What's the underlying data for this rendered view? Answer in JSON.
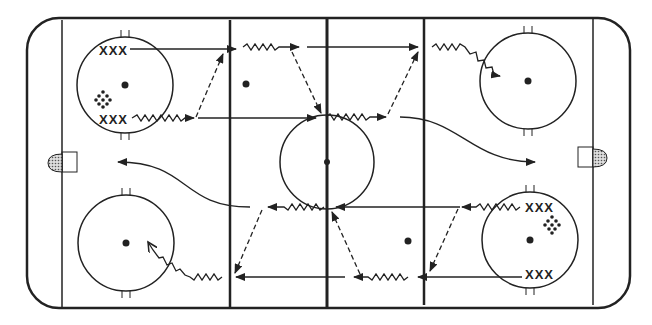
{
  "diagram": {
    "type": "hockey-drill",
    "colors": {
      "ink": "#222222",
      "background": "#ffffff",
      "net": "#999999"
    },
    "player_groups": [
      {
        "label": "XXX",
        "position": "top-left-circle-upper"
      },
      {
        "label": "XXX",
        "position": "top-left-circle-lower"
      },
      {
        "label": "XXX",
        "position": "bottom-right-circle-upper"
      },
      {
        "label": "XXX",
        "position": "bottom-right-circle-lower"
      }
    ],
    "pucks": [
      {
        "icon": "puck-cluster-icon",
        "position": "top-left-circle"
      },
      {
        "icon": "puck-cluster-icon",
        "position": "bottom-right-circle"
      }
    ],
    "legend": {
      "solid_arrow": "skate path",
      "wavy_arrow": "skate with puck",
      "dashed_arrow": "pass"
    }
  }
}
